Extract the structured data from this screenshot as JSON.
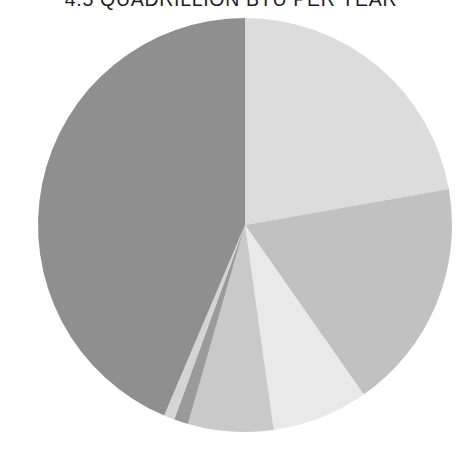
{
  "title": {
    "text": "QUADRILLION BTU PER YEAR",
    "full_text": "4.5 QUADRILLION BTU PER YEAR",
    "cropped": "true",
    "color": "#1d1d1d"
  },
  "chart_data": {
    "type": "pie",
    "title": "4.5 QUADRILLION BTU PER YEAR",
    "subtitle": "",
    "xlabel": "",
    "ylabel": "",
    "legend": "none",
    "grid": "off",
    "labels_shown": "false",
    "start_angle_deg": 0,
    "direction": "clockwise",
    "center": {
      "x": 245,
      "y": 225
    },
    "radius": 207,
    "categories": [
      "Slice 1",
      "Slice 2",
      "Slice 3",
      "Slice 4",
      "Slice 5",
      "Slice 6",
      "Slice 7"
    ],
    "values": [
      22.2,
      18.1,
      7.5,
      6.7,
      1.1,
      0.8,
      43.6
    ],
    "units": "percent",
    "colors": [
      "#dcdcdc",
      "#c1c1c1",
      "#e9e9e9",
      "#c9c9c9",
      "#9a9a9a",
      "#d4d4d4",
      "#8f8f8f"
    ],
    "angles_deg": [
      {
        "start": 0.0,
        "end": 80.0
      },
      {
        "start": 80.0,
        "end": 145.0
      },
      {
        "start": 145.0,
        "end": 172.0
      },
      {
        "start": 172.0,
        "end": 196.0
      },
      {
        "start": 196.0,
        "end": 200.0
      },
      {
        "start": 200.0,
        "end": 203.0
      },
      {
        "start": 203.0,
        "end": 360.0
      }
    ]
  },
  "canvas": {
    "width": 462,
    "height": 450,
    "background": "#ffffff"
  }
}
